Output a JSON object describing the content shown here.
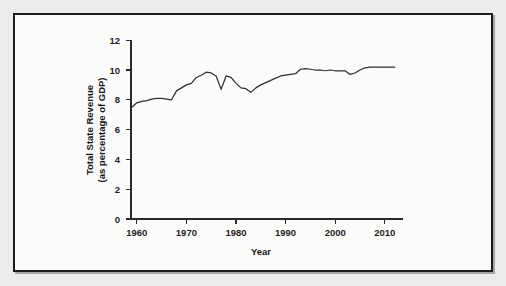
{
  "figure": {
    "frame_color": "#1b1b1b",
    "background_color": "#fbfbfa",
    "line_color": "#2f2f2f"
  },
  "chart_data": {
    "type": "line",
    "title": "",
    "xlabel": "Year",
    "ylabel": "Total State Revenue (as percentage of GDP)",
    "ylabel_line1": "Total State Revenue",
    "ylabel_line2": "(as percentage of GDP)",
    "xlim": [
      1957,
      2013
    ],
    "ylim": [
      0,
      12
    ],
    "xticks": [
      1960,
      1970,
      1980,
      1990,
      2000,
      2010
    ],
    "xtick_labels": [
      "1960",
      "1970",
      "1980",
      "1990",
      "2000",
      "2010"
    ],
    "yticks": [
      0,
      2,
      4,
      6,
      8,
      10,
      12
    ],
    "ytick_labels": [
      "0",
      "2",
      "4",
      "6",
      "8",
      "10",
      "12"
    ],
    "grid": false,
    "legend": false,
    "series": [
      {
        "name": "Total State Revenue (as percentage of GDP)",
        "x": [
          1959,
          1960,
          1961,
          1962,
          1963,
          1964,
          1965,
          1966,
          1967,
          1968,
          1969,
          1970,
          1971,
          1972,
          1973,
          1974,
          1975,
          1976,
          1977,
          1978,
          1979,
          1980,
          1981,
          1982,
          1983,
          1984,
          1985,
          1986,
          1987,
          1988,
          1989,
          1990,
          1991,
          1992,
          1993,
          1994,
          1995,
          1996,
          1997,
          1998,
          1999,
          2000,
          2001,
          2002,
          2003,
          2004,
          2005,
          2006,
          2007,
          2008,
          2009,
          2010,
          2011,
          2012
        ],
        "values": [
          7.5,
          7.8,
          7.9,
          7.95,
          8.05,
          8.1,
          8.1,
          8.05,
          8.0,
          8.6,
          8.8,
          9.0,
          9.1,
          9.5,
          9.65,
          9.85,
          9.8,
          9.6,
          8.7,
          9.6,
          9.5,
          9.1,
          8.8,
          8.75,
          8.5,
          8.8,
          9.0,
          9.15,
          9.3,
          9.45,
          9.6,
          9.65,
          9.7,
          9.75,
          10.05,
          10.1,
          10.05,
          10.0,
          10.0,
          9.95,
          10.0,
          9.95,
          9.95,
          9.95,
          9.7,
          9.8,
          10.0,
          10.15,
          10.2,
          10.2,
          10.2,
          10.2,
          10.2,
          10.2
        ]
      }
    ]
  }
}
